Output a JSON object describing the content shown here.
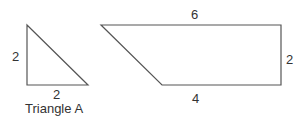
{
  "triangle": {
    "name": "Triangle A",
    "height_label": "2",
    "base_label": "2",
    "points": "27,25 27,85 88,85"
  },
  "trapezoid": {
    "top_label": "6",
    "right_label": "2",
    "bottom_label": "4",
    "points": "101,25 281,25 281,85 162,85"
  },
  "colors": {
    "stroke": "#555555",
    "text": "#333333"
  }
}
